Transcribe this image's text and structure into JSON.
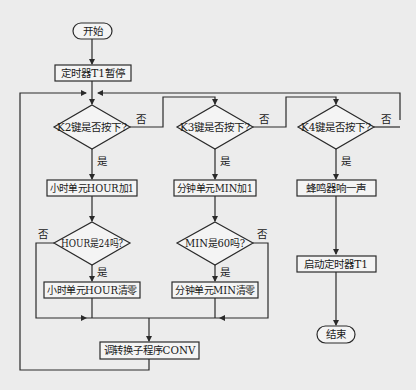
{
  "flowchart": {
    "start": "开始",
    "end": "结束",
    "stop_timer": "定时器T1暂停",
    "decisions": {
      "k2": "K2键是否按下?",
      "k3": "K3键是否按下?",
      "k4": "K4键是否按下?",
      "hour24": "HOUR是24吗?",
      "min60": "MIN是60吗?"
    },
    "processes": {
      "hour_inc": "小时单元HOUR加1",
      "min_inc": "分钟单元MIN加1",
      "beep": "蜂鸣器响一声",
      "hour_clear": "小时单元HOUR清零",
      "min_clear": "分钟单元MIN清零",
      "start_timer": "启动定时器T1",
      "conv": "调转换子程序CONV"
    },
    "yes_label": "是",
    "no_label": "否"
  }
}
